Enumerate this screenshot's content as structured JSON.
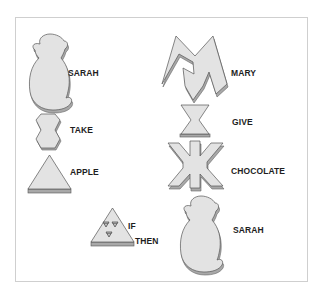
{
  "figure": {
    "colors": {
      "token_fill": "#e3e3e3",
      "token_edge": "#8a8a8a",
      "token_shadow": "#a8a8a8",
      "outline": "#555555",
      "text": "#1e1e1e",
      "frame_border": "#cfcfcf"
    },
    "left_column": [
      {
        "id": "sarah-1",
        "shape": "monkey-silhouette",
        "label": "SARAH"
      },
      {
        "id": "take",
        "shape": "notched-hexagon",
        "label": "TAKE"
      },
      {
        "id": "apple",
        "shape": "triangle",
        "label": "APPLE"
      },
      {
        "id": "if-then",
        "shape": "triangle-with-marks",
        "label_1": "IF",
        "label_2": "THEN"
      }
    ],
    "right_column": [
      {
        "id": "mary",
        "shape": "letter-m",
        "label": "MARY"
      },
      {
        "id": "give",
        "shape": "hourglass",
        "label": "GIVE"
      },
      {
        "id": "chocolate",
        "shape": "asterisk-cross",
        "label": "CHOCOLATE"
      },
      {
        "id": "sarah-2",
        "shape": "monkey-silhouette",
        "label": "SARAH"
      }
    ]
  }
}
